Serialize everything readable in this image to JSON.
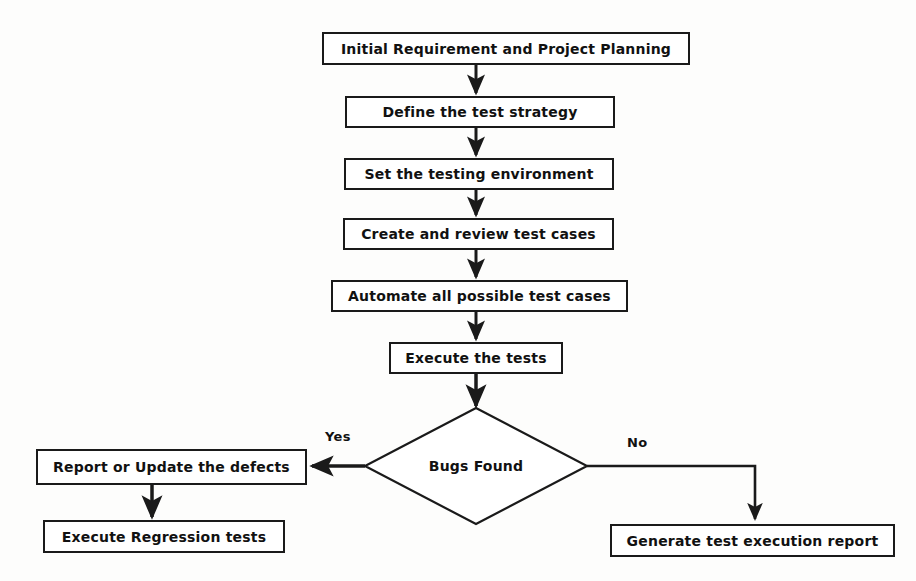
{
  "diagram": {
    "background_color": "#fdfdfc",
    "line_color": "#1a1a1a",
    "text_color": "#111111",
    "nodes": [
      {
        "id": "initial-requirement",
        "label": "Initial Requirement and Project Planning",
        "shape": "process",
        "x": 322,
        "y": 32,
        "w": 368,
        "h": 33,
        "font_size": 14
      },
      {
        "id": "define-test-strategy",
        "label": "Define the test strategy",
        "shape": "process",
        "x": 345,
        "y": 96,
        "w": 270,
        "h": 32,
        "font_size": 14
      },
      {
        "id": "set-testing-environment",
        "label": "Set the testing environment",
        "shape": "process",
        "x": 344,
        "y": 158,
        "w": 270,
        "h": 32,
        "font_size": 14
      },
      {
        "id": "create-review-test-cases",
        "label": "Create and review test cases",
        "shape": "process",
        "x": 343,
        "y": 218,
        "w": 271,
        "h": 32,
        "font_size": 14
      },
      {
        "id": "automate-test-cases",
        "label": "Automate all possible test cases",
        "shape": "process",
        "x": 331,
        "y": 280,
        "w": 297,
        "h": 32,
        "font_size": 14
      },
      {
        "id": "execute-the-tests",
        "label": "Execute the tests",
        "shape": "process",
        "x": 389,
        "y": 342,
        "w": 174,
        "h": 32,
        "font_size": 14
      },
      {
        "id": "bugs-found",
        "label": "Bugs Found",
        "shape": "decision",
        "cx": 476,
        "cy": 466,
        "rx": 111,
        "ry": 58,
        "font_size": 14
      },
      {
        "id": "report-update-defects",
        "label": "Report or Update the defects",
        "shape": "process",
        "x": 36,
        "y": 449,
        "w": 271,
        "h": 36,
        "font_size": 14
      },
      {
        "id": "execute-regression-tests",
        "label": "Execute Regression tests",
        "shape": "process",
        "x": 43,
        "y": 520,
        "w": 242,
        "h": 33,
        "font_size": 14
      },
      {
        "id": "generate-test-report",
        "label": "Generate test execution report",
        "shape": "process",
        "x": 610,
        "y": 524,
        "w": 285,
        "h": 33,
        "font_size": 14
      }
    ],
    "edges": [
      {
        "id": "e1",
        "from": "initial-requirement",
        "to": "define-test-strategy",
        "label": ""
      },
      {
        "id": "e2",
        "from": "define-test-strategy",
        "to": "set-testing-environment",
        "label": ""
      },
      {
        "id": "e3",
        "from": "set-testing-environment",
        "to": "create-review-test-cases",
        "label": ""
      },
      {
        "id": "e4",
        "from": "create-review-test-cases",
        "to": "automate-test-cases",
        "label": ""
      },
      {
        "id": "e5",
        "from": "automate-test-cases",
        "to": "execute-the-tests",
        "label": ""
      },
      {
        "id": "e6",
        "from": "execute-the-tests",
        "to": "bugs-found",
        "label": ""
      },
      {
        "id": "e7",
        "from": "bugs-found",
        "to": "report-update-defects",
        "label": "Yes"
      },
      {
        "id": "e8",
        "from": "report-update-defects",
        "to": "execute-regression-tests",
        "label": ""
      },
      {
        "id": "e9",
        "from": "bugs-found",
        "to": "generate-test-report",
        "label": "No"
      }
    ],
    "edge_labels": [
      {
        "id": "yes-label",
        "text": "Yes",
        "x": 325,
        "y": 429
      },
      {
        "id": "no-label",
        "text": "No",
        "x": 627,
        "y": 435
      }
    ]
  }
}
